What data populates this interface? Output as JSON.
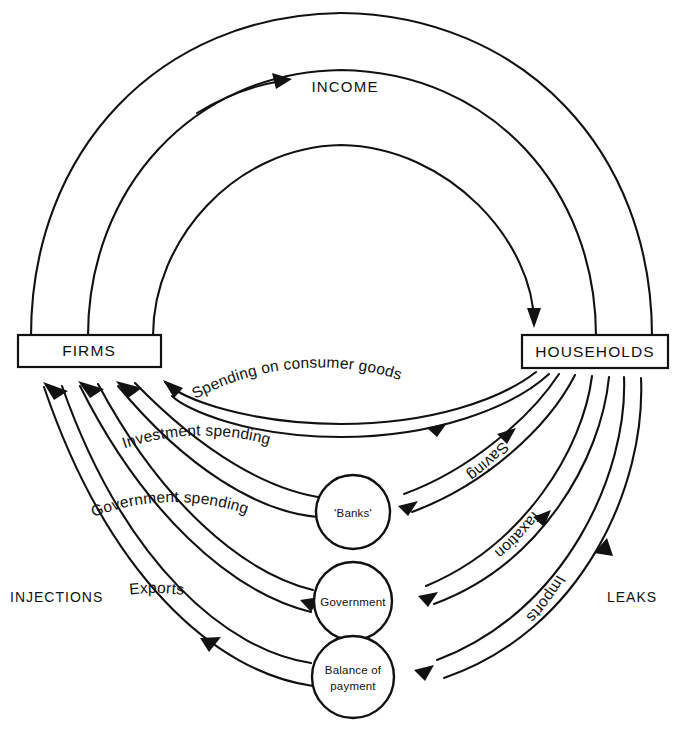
{
  "diagram": {
    "colors": {
      "ink": "#111111",
      "background": "#ffffff"
    },
    "nodes": {
      "firms": "FIRMS",
      "households": "HOUSEHOLDS",
      "banks": "'Banks'",
      "government": "Government",
      "balance_line1": "Balance of",
      "balance_line2": "payment"
    },
    "side_labels": {
      "injections": "INJECTIONS",
      "leaks": "LEAKS"
    },
    "top_label": "INCOME",
    "flows": [
      {
        "id": "income",
        "label": "INCOME",
        "from": "firms",
        "to": "households",
        "direction": "clockwise",
        "kind": "income"
      },
      {
        "id": "spending-consumer-goods",
        "label": "Spending on consumer goods",
        "from": "households",
        "to": "firms",
        "direction": "leftward",
        "kind": "expenditure"
      },
      {
        "id": "saving",
        "label": "Saving",
        "from": "households",
        "to": "banks",
        "direction": "inward",
        "kind": "leak"
      },
      {
        "id": "investment-spending",
        "label": "Investment spending",
        "from": "banks",
        "to": "firms",
        "direction": "leftward",
        "kind": "injection"
      },
      {
        "id": "taxation",
        "label": "Taxation",
        "from": "households",
        "to": "government",
        "direction": "inward",
        "kind": "leak"
      },
      {
        "id": "government-spending",
        "label": "Government spending",
        "from": "government",
        "to": "firms",
        "direction": "leftward",
        "kind": "injection"
      },
      {
        "id": "imports",
        "label": "Imports",
        "from": "households",
        "to": "balance-of-payment",
        "direction": "inward",
        "kind": "leak"
      },
      {
        "id": "exports",
        "label": "Exports",
        "from": "balance-of-payment",
        "to": "firms",
        "direction": "leftward",
        "kind": "injection"
      }
    ],
    "arc_labels": {
      "spending_on_consumer_goods": "Spending on consumer goods",
      "investment_spending": "Investment spending",
      "government_spending": "Government spending",
      "exports": "Exports",
      "saving": "Saving",
      "taxation": "Taxation",
      "imports": "Imports"
    }
  }
}
